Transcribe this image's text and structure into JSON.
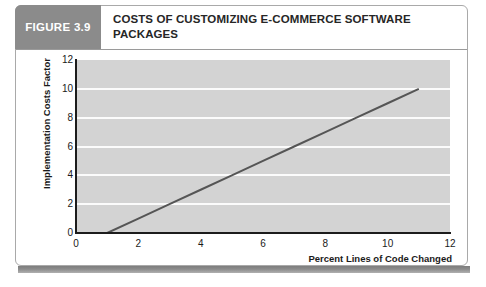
{
  "figure": {
    "tag": "FIGURE 3.9",
    "title": "COSTS OF CUSTOMIZING E-COMMERCE SOFTWARE PACKAGES",
    "tag_background": "#8b8b8b",
    "tag_text_color": "#ffffff"
  },
  "chart_data": {
    "type": "line",
    "title": "COSTS OF CUSTOMIZING E-COMMERCE SOFTWARE PACKAGES",
    "xlabel": "Percent Lines of Code Changed",
    "ylabel": "Implementation Costs Factor",
    "xlim": [
      0,
      12
    ],
    "ylim": [
      0,
      12
    ],
    "xticks": [
      0,
      2,
      4,
      6,
      8,
      10,
      12
    ],
    "yticks": [
      0,
      2,
      4,
      6,
      8,
      10,
      12
    ],
    "grid": "horizontal",
    "legend": "none",
    "plot_background": "#d3d3d3",
    "gridline_color": "#fbfbfb",
    "series": [
      {
        "name": "Implementation Costs Factor",
        "color": "#555555",
        "line_width": 2,
        "x": [
          1,
          11
        ],
        "y": [
          0,
          10
        ],
        "points": [
          {
            "x": 1,
            "y": 0
          },
          {
            "x": 2,
            "y": 1
          },
          {
            "x": 3,
            "y": 2
          },
          {
            "x": 4,
            "y": 3
          },
          {
            "x": 5,
            "y": 4
          },
          {
            "x": 6,
            "y": 5
          },
          {
            "x": 7,
            "y": 6
          },
          {
            "x": 8,
            "y": 7
          },
          {
            "x": 9,
            "y": 8
          },
          {
            "x": 10,
            "y": 9
          },
          {
            "x": 11,
            "y": 10
          }
        ]
      }
    ]
  }
}
